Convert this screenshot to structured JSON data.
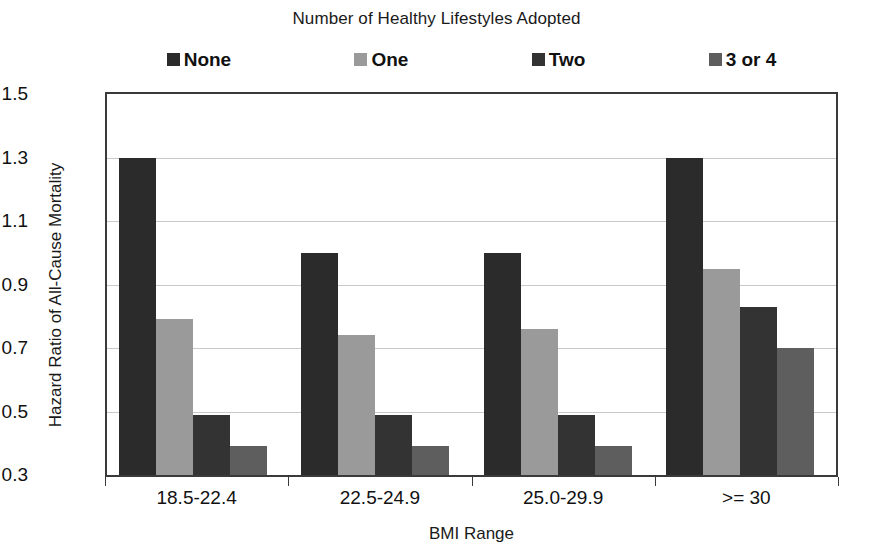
{
  "chart_data": {
    "type": "bar",
    "title": "Number of Healthy Lifestyles Adopted",
    "xlabel": "BMI Range",
    "ylabel": "Hazard Ratio of All-Cause Mortality",
    "categories": [
      "18.5-22.4",
      "22.5-24.9",
      "25.0-29.9",
      ">= 30"
    ],
    "series": [
      {
        "name": "None",
        "color": "#2b2b2b",
        "values": [
          1.3,
          1.0,
          1.0,
          1.3
        ]
      },
      {
        "name": "One",
        "color": "#9a9a9a",
        "values": [
          0.79,
          0.74,
          0.76,
          0.95
        ]
      },
      {
        "name": "Two",
        "color": "#333333",
        "values": [
          0.49,
          0.49,
          0.49,
          0.83
        ]
      },
      {
        "name": "3 or 4",
        "color": "#5e5e5e",
        "values": [
          0.39,
          0.39,
          0.39,
          0.7
        ]
      }
    ],
    "ylim": [
      0.3,
      1.5
    ],
    "yticks": [
      "0.3",
      "0.5",
      "0.7",
      "0.9",
      "1.1",
      "1.3",
      "1.5"
    ],
    "ytick_values": [
      0.3,
      0.5,
      0.7,
      0.9,
      1.1,
      1.3,
      1.5
    ],
    "grid": true,
    "legend_position": "top"
  }
}
